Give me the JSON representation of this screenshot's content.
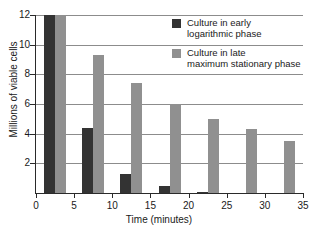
{
  "chart_data": {
    "type": "bar",
    "title": "",
    "xlabel": "Time (minutes)",
    "ylabel": "Millions of viable cells",
    "xlim": [
      0,
      35
    ],
    "ylim": [
      0,
      12
    ],
    "xticks": [
      0,
      5,
      10,
      15,
      20,
      25,
      30,
      35
    ],
    "yticks": [
      2,
      4,
      6,
      8,
      10,
      12
    ],
    "grid": "horizontal",
    "legend_position": "top-right",
    "x": [
      2.5,
      7.5,
      12.5,
      17.5,
      22.5,
      27.5,
      32.5
    ],
    "series": [
      {
        "name": "Culture in early\nlogarithmic phase",
        "color": "#333333",
        "values": [
          12.0,
          4.4,
          1.3,
          0.45,
          0.1,
          0,
          0
        ]
      },
      {
        "name": "Culture in late\nmaximum stationary phase",
        "color": "#909090",
        "values": [
          12.0,
          9.3,
          7.4,
          6.0,
          5.0,
          4.3,
          3.5
        ]
      }
    ]
  },
  "axes": {
    "y_label": "Millions of viable cells",
    "x_label": "Time (minutes)",
    "y_tick_labels": [
      "2",
      "4",
      "6",
      "8",
      "10",
      "12"
    ],
    "x_tick_labels": [
      "0",
      "5",
      "10",
      "15",
      "20",
      "25",
      "30",
      "35"
    ]
  },
  "legend": {
    "items": [
      {
        "label": "Culture in early\nlogarithmic phase",
        "color": "#333333"
      },
      {
        "label": "Culture in late\nmaximum stationary phase",
        "color": "#909090"
      }
    ]
  },
  "caption": {
    "text": ""
  }
}
